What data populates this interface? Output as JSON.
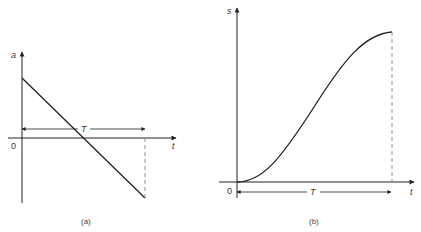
{
  "figure_a": {
    "caption": "(a)",
    "y_axis_label": "a",
    "x_axis_label": "t",
    "origin_label": "0",
    "interval_label": "T",
    "description": "Acceleration decreasing linearly from positive to negative over interval T"
  },
  "figure_b": {
    "caption": "(b)",
    "y_axis_label": "s",
    "x_axis_label": "t",
    "origin_label": "0",
    "interval_label": "T",
    "description": "Displacement S-curve rising from 0 to maximum over interval T"
  },
  "colors": {
    "line": "#222222",
    "dashed": "#888888",
    "text": "#333333"
  }
}
